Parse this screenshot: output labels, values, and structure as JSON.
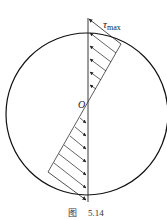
{
  "figure": {
    "labels": {
      "tau": "τ",
      "tau_sub": "max",
      "origin": "O"
    },
    "caption": {
      "prefix": "图",
      "number": "5.14"
    }
  }
}
